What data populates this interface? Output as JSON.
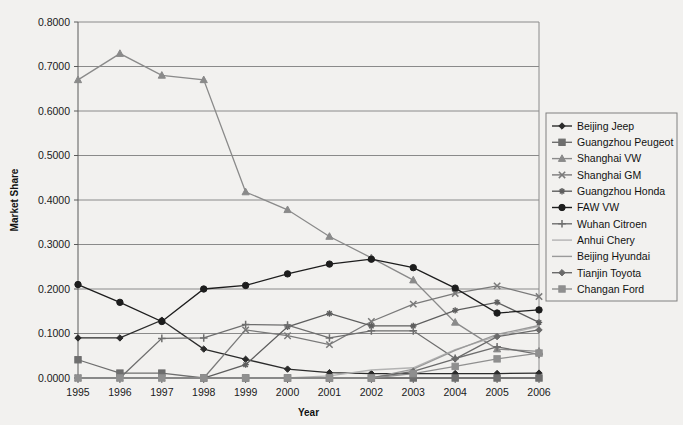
{
  "chart_data": {
    "type": "line",
    "title": "",
    "xlabel": "Year",
    "ylabel": "Market Share",
    "categories": [
      "1995",
      "1996",
      "1997",
      "1998",
      "1999",
      "2000",
      "2001",
      "2002",
      "2003",
      "2004",
      "2005",
      "2006"
    ],
    "x": [
      1995,
      1996,
      1997,
      1998,
      1999,
      2000,
      2001,
      2002,
      2003,
      2004,
      2005,
      2006
    ],
    "xlim": [
      1995,
      2006
    ],
    "ylim": [
      0.0,
      0.8
    ],
    "yticks": [
      "0.0000",
      "0.1000",
      "0.2000",
      "0.3000",
      "0.4000",
      "0.5000",
      "0.6000",
      "0.7000",
      "0.8000"
    ],
    "ytick_values": [
      0.0,
      0.1,
      0.2,
      0.3,
      0.4,
      0.5,
      0.6,
      0.7,
      0.8
    ],
    "grid": "horizontal",
    "legend_position": "right",
    "series": [
      {
        "name": "Beijing Jeep",
        "marker": "diamond",
        "color": "#2b2b2b",
        "values": [
          0.09,
          0.09,
          0.13,
          0.065,
          0.042,
          0.02,
          0.012,
          0.01,
          0.01,
          0.01,
          0.01,
          0.011
        ]
      },
      {
        "name": "Guangzhou Peugeot",
        "marker": "square",
        "color": "#6e6e6e",
        "values": [
          0.041,
          0.011,
          0.011,
          0.0,
          0.0,
          0.0,
          0.0,
          0.0,
          0.0,
          0.0,
          0.0,
          0.0
        ]
      },
      {
        "name": "Shanghai VW",
        "marker": "triangle",
        "color": "#8a8a8a",
        "values": [
          0.67,
          0.729,
          0.68,
          0.67,
          0.418,
          0.378,
          0.318,
          0.27,
          0.22,
          0.125,
          0.065,
          0.06
        ]
      },
      {
        "name": "Shanghai GM",
        "marker": "cross",
        "color": "#7a7a7a",
        "values": [
          0.0,
          0.0,
          0.0,
          0.0,
          0.108,
          0.095,
          0.075,
          0.127,
          0.166,
          0.19,
          0.207,
          0.183
        ]
      },
      {
        "name": "Guangzhou Honda",
        "marker": "asterisk",
        "color": "#5e5e5e",
        "values": [
          0.0,
          0.0,
          0.0,
          0.0,
          0.03,
          0.115,
          0.145,
          0.117,
          0.117,
          0.152,
          0.17,
          0.125
        ]
      },
      {
        "name": "FAW VW",
        "marker": "circle",
        "color": "#1d1d1d",
        "values": [
          0.21,
          0.17,
          0.127,
          0.2,
          0.208,
          0.234,
          0.256,
          0.267,
          0.248,
          0.202,
          0.146,
          0.153
        ]
      },
      {
        "name": "Wuhan Citroen",
        "marker": "plus",
        "color": "#6e6e6e",
        "values": [
          0.0,
          0.0,
          0.089,
          0.09,
          0.12,
          0.119,
          0.09,
          0.106,
          0.106,
          0.044,
          0.07,
          0.053
        ]
      },
      {
        "name": "Anhui Chery",
        "marker": "none",
        "color": "#b3b3b3",
        "values": [
          0.0,
          0.0,
          0.0,
          0.0,
          0.0,
          0.0,
          0.005,
          0.018,
          0.023,
          0.064,
          0.094,
          0.116
        ]
      },
      {
        "name": "Beijing Hyundai",
        "marker": "none",
        "color": "#9a9a9a",
        "values": [
          0.0,
          0.0,
          0.0,
          0.0,
          0.0,
          0.0,
          0.0,
          0.0,
          0.02,
          0.062,
          0.098,
          0.118
        ]
      },
      {
        "name": "Tianjin Toyota",
        "marker": "diamond",
        "color": "#6a6a6a",
        "values": [
          0.0,
          0.0,
          0.0,
          0.0,
          0.0,
          0.0,
          0.0,
          0.0,
          0.015,
          0.043,
          0.093,
          0.108
        ]
      },
      {
        "name": "Changan Ford",
        "marker": "square",
        "color": "#8f8f8f",
        "values": [
          0.0,
          0.0,
          0.0,
          0.0,
          0.0,
          0.0,
          0.0,
          0.0,
          0.01,
          0.026,
          0.043,
          0.056
        ]
      }
    ]
  },
  "legend": {
    "items": [
      {
        "label": "Beijing Jeep"
      },
      {
        "label": "Guangzhou Peugeot"
      },
      {
        "label": "Shanghai VW"
      },
      {
        "label": "Shanghai GM"
      },
      {
        "label": "Guangzhou Honda"
      },
      {
        "label": "FAW VW"
      },
      {
        "label": "Wuhan Citroen"
      },
      {
        "label": "Anhui Chery"
      },
      {
        "label": "Beijing Hyundai"
      },
      {
        "label": "Tianjin Toyota"
      },
      {
        "label": "Changan Ford"
      }
    ]
  }
}
